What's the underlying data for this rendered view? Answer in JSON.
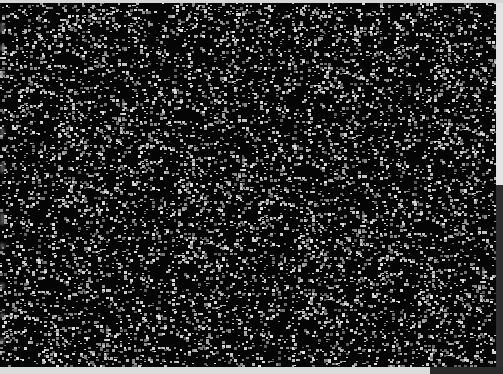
{
  "canvas": {
    "width": 503,
    "height": 374,
    "noise_region": {
      "x": 0,
      "y": 3,
      "width": 496,
      "height": 364
    },
    "background_color": "#050505",
    "dot_color_min": "#5a5a5a",
    "dot_color_max": "#e0e0e0",
    "dot_density": 0.16
  },
  "frame": {
    "top_strip_color": "#d6d6d6",
    "bottom_strip_color": "#dcdcdc",
    "right_panel_color": "#2e2e2e",
    "bottom_right_block_color": "#2a2a2a"
  },
  "edge_marks": [
    {
      "y": 20,
      "h": 10
    },
    {
      "y": 42,
      "h": 6
    },
    {
      "y": 68,
      "h": 6
    },
    {
      "y": 125,
      "h": 8
    },
    {
      "y": 160,
      "h": 10
    },
    {
      "y": 210,
      "h": 12
    },
    {
      "y": 240,
      "h": 6
    },
    {
      "y": 280,
      "h": 6
    },
    {
      "y": 310,
      "h": 5
    },
    {
      "y": 335,
      "h": 6
    }
  ]
}
